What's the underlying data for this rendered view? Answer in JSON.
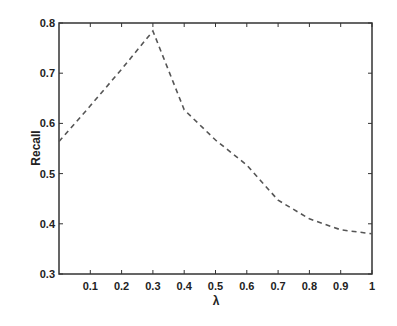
{
  "chart_data": {
    "type": "line",
    "title": "",
    "xlabel": "λ",
    "ylabel": "Recall",
    "xlim": [
      0,
      1
    ],
    "ylim": [
      0.3,
      0.8
    ],
    "grid": false,
    "legend": null,
    "x_ticks": [
      "0.1",
      "0.2",
      "0.3",
      "0.4",
      "0.5",
      "0.6",
      "0.7",
      "0.8",
      "0.9",
      "1"
    ],
    "x_tick_values": [
      0.1,
      0.2,
      0.3,
      0.4,
      0.5,
      0.6,
      0.7,
      0.8,
      0.9,
      1.0
    ],
    "y_ticks": [
      "0.3",
      "0.4",
      "0.5",
      "0.6",
      "0.7",
      "0.8"
    ],
    "y_tick_values": [
      0.3,
      0.4,
      0.5,
      0.6,
      0.7,
      0.8
    ],
    "series": [
      {
        "name": "Recall",
        "line_style": "dashed",
        "color": "#555555",
        "x": [
          0.0,
          0.1,
          0.2,
          0.3,
          0.4,
          0.5,
          0.6,
          0.7,
          0.8,
          0.9,
          1.0
        ],
        "values": [
          0.564,
          0.635,
          0.708,
          0.784,
          0.627,
          0.567,
          0.517,
          0.447,
          0.41,
          0.388,
          0.38
        ]
      }
    ]
  },
  "labels": {
    "xlabel": "λ",
    "ylabel": "Recall"
  }
}
